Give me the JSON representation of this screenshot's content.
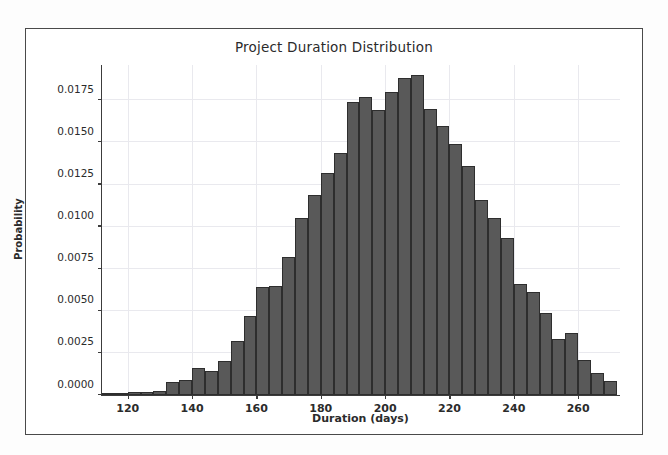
{
  "figure": {
    "background": "#ffffff",
    "frame_color": "#4a4a4a"
  },
  "chart_data": {
    "type": "bar",
    "title": "Project Duration Distribution",
    "xlabel": "Duration (days)",
    "ylabel": "Probability",
    "xlim": [
      112,
      273
    ],
    "ylim": [
      0,
      0.0196
    ],
    "xticks": [
      120,
      140,
      160,
      180,
      200,
      220,
      240,
      260
    ],
    "yticks": [
      0.0,
      0.0025,
      0.005,
      0.0075,
      0.01,
      0.0125,
      0.015,
      0.0175
    ],
    "ytick_labels": [
      "0.0000",
      "0.0025",
      "0.0050",
      "0.0075",
      "0.0100",
      "0.0125",
      "0.0150",
      "0.0175"
    ],
    "xtick_labels": [
      "120",
      "140",
      "160",
      "180",
      "200",
      "220",
      "240",
      "260"
    ],
    "grid": true,
    "grid_color": "#e9e9ee",
    "bar_color": "#595959",
    "bar_edge_color": "#2e2e2e",
    "bin_width": 4.0,
    "bin_edges": [
      112,
      116,
      120,
      124,
      128,
      132,
      136,
      140,
      144,
      148,
      152,
      156,
      160,
      164,
      168,
      172,
      176,
      180,
      184,
      188,
      192,
      196,
      200,
      204,
      208,
      212,
      216,
      220,
      224,
      228,
      232,
      236,
      240,
      244,
      248,
      252,
      256,
      260,
      264,
      268,
      272
    ],
    "categories": [
      114,
      118,
      122,
      126,
      130,
      134,
      138,
      142,
      146,
      150,
      154,
      158,
      162,
      166,
      170,
      174,
      178,
      182,
      186,
      190,
      194,
      198,
      202,
      206,
      210,
      214,
      218,
      222,
      226,
      230,
      234,
      238,
      242,
      246,
      250,
      254,
      258,
      262,
      266,
      270
    ],
    "values": [
      5e-05,
      8e-05,
      0.00018,
      0.0002,
      0.00025,
      0.00075,
      0.0009,
      0.0016,
      0.0014,
      0.002,
      0.0032,
      0.0047,
      0.0064,
      0.0065,
      0.0082,
      0.0105,
      0.0119,
      0.0132,
      0.0144,
      0.0174,
      0.0177,
      0.0169,
      0.018,
      0.0188,
      0.019,
      0.017,
      0.016,
      0.0149,
      0.0136,
      0.0116,
      0.0105,
      0.0093,
      0.0066,
      0.0061,
      0.0049,
      0.0033,
      0.0037,
      0.0021,
      0.0013,
      0.00085
    ],
    "tail_values": [
      0.0006,
      0.0004,
      0.00025,
      0.00012,
      6e-05
    ]
  }
}
